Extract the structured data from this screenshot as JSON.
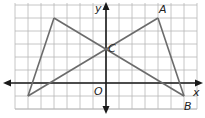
{
  "figure": {
    "grid": {
      "x_min": -7,
      "x_max": 7,
      "y_min": -2,
      "y_max": 6,
      "spacing_px": 13,
      "origin_px": [
        106,
        83
      ],
      "grid_color": "#b8b8b8"
    },
    "axes": {
      "x_label": "x",
      "y_label": "y",
      "origin_label": "O",
      "axis_color": "#1a1a1a"
    },
    "segments_color": "#6b6b6b",
    "points": [
      {
        "label": "A",
        "x": 4,
        "y": 5,
        "labeled": true
      },
      {
        "label": "B",
        "x": 6,
        "y": -1,
        "labeled": true
      },
      {
        "label": "C",
        "x": 0,
        "y": 2,
        "labeled": true
      },
      {
        "label": "",
        "x": -4,
        "y": 5,
        "labeled": false
      },
      {
        "label": "",
        "x": -6,
        "y": -1,
        "labeled": false
      }
    ],
    "segments": [
      {
        "from": [
          -4,
          5
        ],
        "to": [
          -6,
          -1
        ]
      },
      {
        "from": [
          -4,
          5
        ],
        "to": [
          6,
          -1
        ]
      },
      {
        "from": [
          -6,
          -1
        ],
        "to": [
          4,
          5
        ]
      },
      {
        "from": [
          4,
          5
        ],
        "to": [
          6,
          -1
        ]
      }
    ]
  }
}
